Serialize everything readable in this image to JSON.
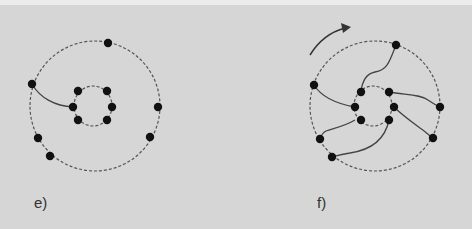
{
  "panels": [
    {
      "id": "e",
      "label": "e)"
    },
    {
      "id": "f",
      "label": "f)"
    }
  ],
  "colors": {
    "background": "#d6d6d6",
    "dot": "#111111",
    "line": "#444444",
    "dashed": "#555555"
  }
}
